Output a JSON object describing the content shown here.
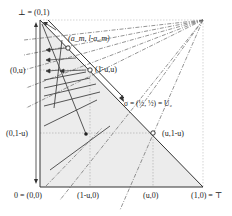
{
  "labels": {
    "top_left": "⊥ = (0,1)",
    "bottom_left": "0 = (0,0)",
    "bottom_right": "(1,0) = ⊤",
    "left_u": "(0,u)",
    "left_1mu": "(0,1-u)",
    "bottom_1mu": "(1-u,0)",
    "bottom_u": "(u,0)",
    "point_am": "(a_m, l-a_m)",
    "point_bar1mu": "(1̄-u,u)",
    "point_sigma": "σ = (½, ½) = U₂",
    "point_u1mu": "(u,1-u)"
  },
  "colors": {
    "line": "#333333",
    "fill": "#e8e8e8",
    "dotted": "#999999",
    "dashdot": "#666666",
    "text": "#222222"
  }
}
